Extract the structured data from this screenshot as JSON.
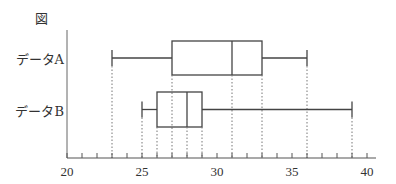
{
  "figure_label": "図",
  "chart_data": {
    "type": "boxplot",
    "title": "",
    "xlabel": "",
    "ylabel": "",
    "xlim": [
      20,
      40
    ],
    "x_ticks_major": [
      20,
      25,
      30,
      35,
      40
    ],
    "x_ticks_minor_step": 1,
    "grid": false,
    "guide_lines": "dotted vertical lines from each box/whisker value down to the axis",
    "series": [
      {
        "name": "データA",
        "min": 23,
        "q1": 27,
        "median": 31,
        "q3": 33,
        "max": 36
      },
      {
        "name": "データB",
        "min": 25,
        "q1": 26,
        "median": 28,
        "q3": 29,
        "max": 39
      }
    ]
  }
}
